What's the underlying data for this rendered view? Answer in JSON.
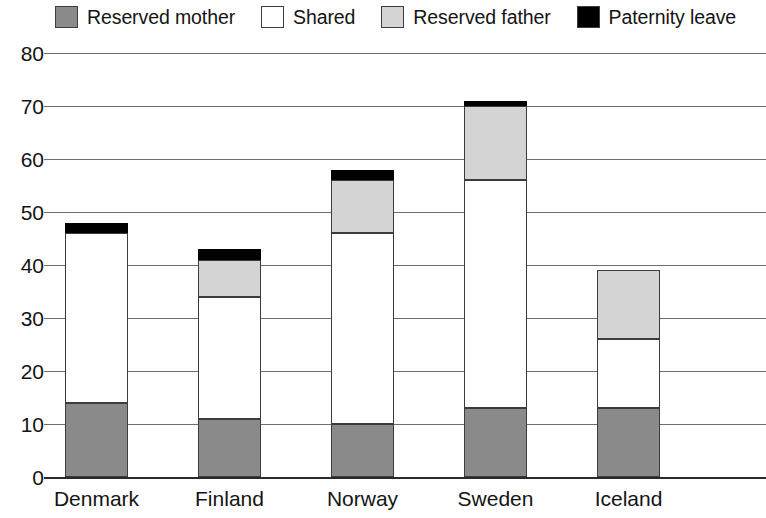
{
  "chart_data": {
    "type": "bar",
    "subtype": "stacked-bar-vertical",
    "title": "",
    "subtitle": "",
    "xlabel": "",
    "ylabel": "",
    "categories": [
      "Denmark",
      "Finland",
      "Norway",
      "Sweden",
      "Iceland"
    ],
    "series": [
      {
        "name": "Reserved mother",
        "color": "#8a8a8a",
        "values": [
          14,
          11,
          10,
          13,
          13
        ]
      },
      {
        "name": "Shared",
        "color": "#ffffff",
        "values": [
          32,
          23,
          36,
          43,
          13
        ]
      },
      {
        "name": "Reserved father",
        "color": "#d4d4d4",
        "values": [
          0,
          7,
          10,
          14,
          13
        ]
      },
      {
        "name": "Paternity leave",
        "color": "#000000",
        "values": [
          2,
          2,
          2,
          1,
          0
        ]
      }
    ],
    "totals": [
      48,
      43,
      58,
      71,
      39
    ],
    "ylim": [
      0,
      80
    ],
    "ytick_step": 10,
    "yticks": [
      0,
      10,
      20,
      30,
      40,
      50,
      60,
      70,
      80
    ],
    "ytick_labels": [
      "0",
      "10",
      "20",
      "30",
      "40",
      "50",
      "60",
      "70",
      "80"
    ],
    "grid": true,
    "grid_axis": "y",
    "legend_position": "top",
    "bar_border_color": "#3c3c3c",
    "gridline_color": "#6e6e6e",
    "axis_color": "#2a2a2a",
    "background": "#ffffff"
  },
  "legend": {
    "items": [
      {
        "label": "Reserved mother",
        "swatch": "#8a8a8a",
        "icon": "legend-swatch-icon"
      },
      {
        "label": "Shared",
        "swatch": "#ffffff",
        "icon": "legend-swatch-icon"
      },
      {
        "label": "Reserved father",
        "swatch": "#d4d4d4",
        "icon": "legend-swatch-icon"
      },
      {
        "label": "Paternity leave",
        "swatch": "#000000",
        "icon": "legend-swatch-icon"
      }
    ]
  }
}
